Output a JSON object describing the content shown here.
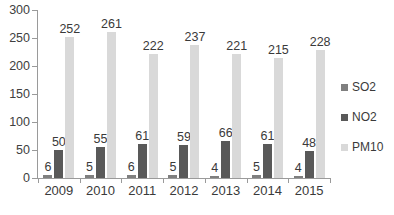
{
  "chart_data": {
    "type": "bar",
    "title": "",
    "subtitle": "",
    "xlabel": "",
    "ylabel": "",
    "ylim": [
      0,
      300
    ],
    "ytick_step": 50,
    "yticks": [
      0,
      50,
      100,
      150,
      200,
      250,
      300
    ],
    "grid": false,
    "legend_position": "right",
    "data_labels": true,
    "categories": [
      "2009",
      "2010",
      "2011",
      "2012",
      "2013",
      "2014",
      "2015"
    ],
    "series": [
      {
        "name": "SO2",
        "color": "#7f7f7f",
        "values": [
          6,
          5,
          6,
          5,
          4,
          5,
          4
        ]
      },
      {
        "name": "NO2",
        "color": "#595959",
        "values": [
          50,
          55,
          61,
          59,
          66,
          61,
          48
        ]
      },
      {
        "name": "PM10",
        "color": "#d9d9d9",
        "values": [
          252,
          261,
          222,
          237,
          221,
          215,
          228
        ]
      }
    ]
  },
  "legend": {
    "items": [
      {
        "label": "SO2",
        "swatch": "so2"
      },
      {
        "label": "NO2",
        "swatch": "no2"
      },
      {
        "label": "PM10",
        "swatch": "pm10"
      }
    ]
  },
  "caption": {
    "clipped_text": ""
  }
}
